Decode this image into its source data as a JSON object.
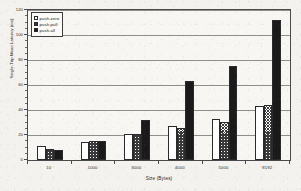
{
  "chart_data": {
    "type": "bar",
    "title": "",
    "xlabel": "Size (Bytes)",
    "ylabel": "Single-Trip Mean Latency (ms)",
    "categories": [
      "10",
      "1000",
      "3000",
      "4000",
      "5000",
      "8192"
    ],
    "series": [
      {
        "name": "push-zero",
        "fill": "white",
        "values": [
          11.5,
          14.5,
          20.5,
          27.0,
          33.0,
          43.5
        ]
      },
      {
        "name": "push-pull",
        "fill": "hatch",
        "values": [
          8.5,
          15.0,
          20.8,
          25.5,
          30.8,
          44.0
        ]
      },
      {
        "name": "push-all",
        "fill": "black",
        "values": [
          8.3,
          15.3,
          32.0,
          63.0,
          75.5,
          112.0
        ]
      }
    ],
    "ylim": [
      0,
      120
    ],
    "yticks": [
      0,
      20,
      40,
      60,
      80,
      100,
      120
    ],
    "yticks_minor": [
      5,
      10,
      15,
      25,
      30,
      35,
      45,
      50,
      55,
      65,
      70,
      75,
      85,
      90,
      95,
      105,
      110,
      115
    ],
    "grid": true,
    "legend_position": "top-left"
  },
  "legend": {
    "entries": [
      {
        "label": "push-zero"
      },
      {
        "label": "push-pull"
      },
      {
        "label": "push-all"
      }
    ]
  },
  "colors": {
    "axis": "#4a4a4a",
    "grid": "#6b6b6b",
    "bar_edge": "#2a2a2a",
    "bar_black": "#1a1a1a",
    "bar_white": "#ffffff",
    "background": "#f3f2ef"
  }
}
